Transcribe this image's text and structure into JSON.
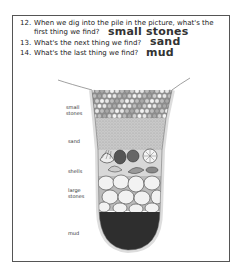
{
  "questions": [
    {
      "number": "12.",
      "line1": "When we dig into the pile in the picture, what's the",
      "line2": "first thing we find?",
      "answer": "small stones"
    },
    {
      "number": "13.",
      "line1": "What's the next thing we find?",
      "answer": "sand"
    },
    {
      "number": "14.",
      "line1": "What's the last thing we find?",
      "answer": "mud"
    }
  ],
  "diagram": {
    "layers": [
      {
        "label_line1": "small",
        "label_line2": "stones"
      },
      {
        "label_line1": "sand"
      },
      {
        "label_line1": "shells"
      },
      {
        "label_line1": "large",
        "label_line2": "stones"
      },
      {
        "label_line1": "mud"
      }
    ]
  }
}
